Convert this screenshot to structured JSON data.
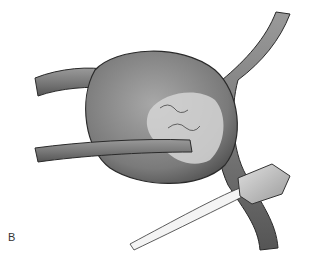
{
  "figure": {
    "panel_label": "B",
    "colors": {
      "background": "#ffffff",
      "vessel": "#8a8a8a",
      "mass": "#7c7c7c",
      "highlight": "#d8d8d8",
      "outline": "#2a2a2a",
      "instrument": "#e6e6e6"
    }
  }
}
